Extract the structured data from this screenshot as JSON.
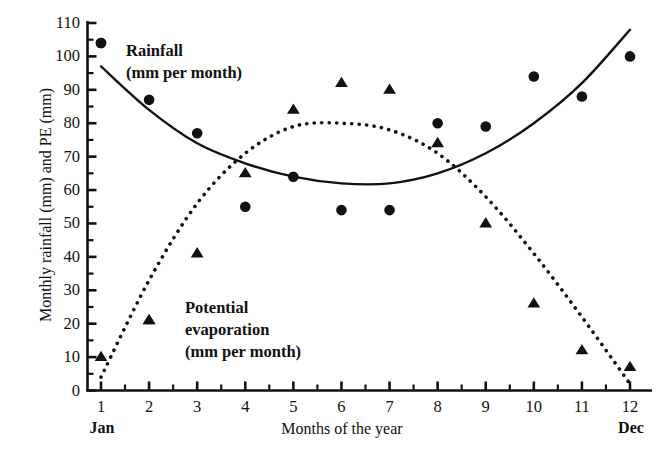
{
  "chart_data": {
    "type": "scatter",
    "title": "",
    "xlabel": "Months of the year",
    "ylabel": "Monthly rainfall (mm) and PE (mm)",
    "x": [
      1,
      2,
      3,
      4,
      5,
      6,
      7,
      8,
      9,
      10,
      11,
      12
    ],
    "xtick_labels": [
      "1",
      "2",
      "3",
      "4",
      "5",
      "6",
      "7",
      "8",
      "9",
      "10",
      "11",
      "12"
    ],
    "ytick_labels": [
      "0",
      "10",
      "20",
      "30",
      "40",
      "50",
      "60",
      "70",
      "80",
      "90",
      "100",
      "110"
    ],
    "xlim": [
      0.4,
      12.6
    ],
    "ylim": [
      0,
      113
    ],
    "grid": false,
    "legend_position": "inside",
    "x_axis_start_label": "Jan",
    "x_axis_end_label": "Dec",
    "minor_ticks_y_step": 5,
    "minor_ticks_x_step": 0.5,
    "series": [
      {
        "name": "Rainfall",
        "legend_label": "Rainfall\n(mm per month)",
        "unit_note": "(mm per month)",
        "marker": "circle",
        "color": "#111111",
        "trend_line_style": "solid",
        "values": [
          104,
          87,
          77,
          55,
          64,
          54,
          54,
          80,
          79,
          94,
          88,
          100
        ],
        "trend_curve": [
          97,
          84,
          74,
          68,
          64,
          62,
          62,
          65,
          71,
          80,
          92,
          108
        ]
      },
      {
        "name": "Potential evaporation",
        "legend_label": "Potential\nevaporation\n(mm per month)",
        "unit_note": "(mm per month)",
        "marker": "triangle",
        "color": "#111111",
        "trend_line_style": "dotted",
        "values": [
          10,
          21,
          41,
          65,
          84,
          92,
          90,
          74,
          50,
          26,
          12,
          7
        ],
        "trend_curve": [
          4,
          33,
          56,
          71,
          79,
          80,
          78,
          71,
          58,
          41,
          22,
          2
        ]
      }
    ]
  }
}
